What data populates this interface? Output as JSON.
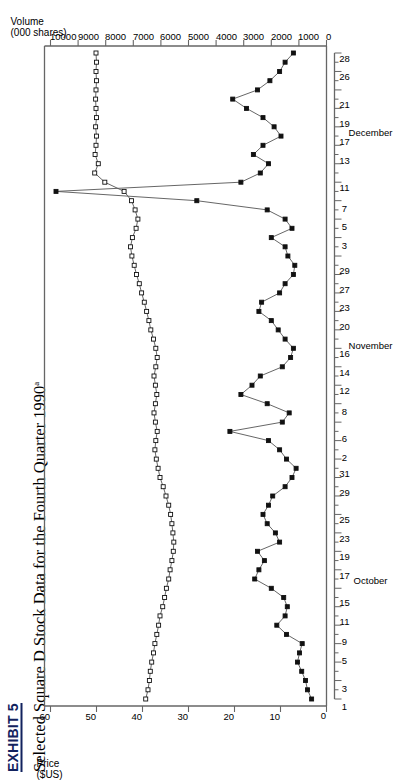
{
  "title": {
    "exhibit": "EXHIBIT 5",
    "subtitle": "Selected Square D Stock Data for the Fourth Quarter 1990",
    "footnote_marker": "a"
  },
  "axes": {
    "price_caption_line1": "Price",
    "price_caption_line2": "($US)",
    "volume_caption_line1": "Volume",
    "volume_caption_line2": "(000 shares)",
    "price_ticks": [
      "0",
      "10",
      "20",
      "30",
      "40",
      "50",
      "60"
    ],
    "volume_ticks": [
      "0",
      "1000",
      "2000",
      "3000",
      "4000",
      "5000",
      "6000",
      "7000",
      "8000",
      "9000",
      "10000"
    ],
    "month_labels": [
      "October",
      "November",
      "December"
    ]
  },
  "chart_data": {
    "type": "line",
    "title": "Selected Square D Stock Data for the Fourth Quarter 1990",
    "xlabel": "",
    "ylabel": "Price ($US)",
    "y2label": "Volume (000 shares)",
    "ylim": [
      0,
      60
    ],
    "y2lim": [
      0,
      10000
    ],
    "grid": false,
    "legend": "none",
    "x_tick_labels": [
      "1",
      "3",
      "5",
      "9",
      "11",
      "15",
      "17",
      "19",
      "23",
      "25",
      "29",
      "31",
      "2",
      "6",
      "8",
      "12",
      "14",
      "16",
      "20",
      "23",
      "27",
      "29",
      "3",
      "5",
      "7",
      "11",
      "13",
      "17",
      "19",
      "21",
      "26",
      "28"
    ],
    "x_month_groups": [
      {
        "month": "October",
        "labels": [
          "1",
          "3",
          "5",
          "9",
          "11",
          "15",
          "17",
          "19",
          "23",
          "25",
          "29",
          "31"
        ]
      },
      {
        "month": "November",
        "labels": [
          "2",
          "6",
          "8",
          "12",
          "14",
          "16",
          "20",
          "23",
          "27",
          "29"
        ]
      },
      {
        "month": "December",
        "labels": [
          "3",
          "5",
          "7",
          "11",
          "13",
          "17",
          "19",
          "21",
          "26",
          "28"
        ]
      }
    ],
    "series": [
      {
        "name": "Price ($US)",
        "marker": "open-square",
        "axis": "left",
        "values": [
          39.3,
          38.8,
          38.5,
          38.3,
          38.0,
          37.6,
          37.3,
          36.9,
          36.5,
          36.2,
          35.6,
          35.2,
          34.8,
          34.3,
          34.0,
          33.6,
          33.3,
          33.2,
          33.4,
          33.6,
          33.9,
          34.3,
          34.9,
          35.5,
          36.2,
          36.6,
          37.0,
          37.3,
          37.1,
          36.8,
          37.2,
          37.5,
          37.2,
          36.9,
          37.2,
          37.5,
          37.1,
          36.8,
          37.1,
          37.6,
          38.2,
          38.6,
          39.1,
          39.6,
          40.2,
          40.7,
          41.3,
          41.8,
          42.3,
          42.6,
          42.2,
          41.4,
          41.0,
          41.6,
          42.4,
          44.0,
          48.2,
          50.4,
          49.6,
          50.3,
          50.1,
          50.0,
          50.2,
          50.0,
          50.1,
          50.2,
          50.1,
          50.0,
          50.1,
          50.0,
          50.1
        ]
      },
      {
        "name": "Volume (000 shares)",
        "marker": "filled-square",
        "axis": "right",
        "values": [
          540,
          690,
          760,
          900,
          1050,
          980,
          880,
          1450,
          1800,
          1500,
          1420,
          1550,
          2000,
          2600,
          2450,
          2250,
          2500,
          1700,
          1850,
          2150,
          2300,
          2100,
          1950,
          1500,
          1250,
          1100,
          1450,
          1700,
          2100,
          3500,
          1600,
          1350,
          2150,
          3100,
          2700,
          2400,
          1600,
          1300,
          1200,
          1500,
          1750,
          2000,
          2450,
          2350,
          1700,
          1500,
          1200,
          1150,
          1400,
          1500,
          2000,
          1250,
          1500,
          2150,
          4700,
          9800,
          3100,
          2400,
          2100,
          2650,
          2300,
          1650,
          1900,
          2300,
          2900,
          3400,
          2500,
          2050,
          1700,
          1500,
          1200
        ]
      }
    ]
  }
}
